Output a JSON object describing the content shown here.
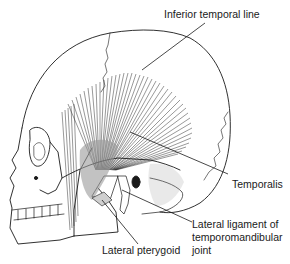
{
  "figure": {
    "labels": {
      "inferior_temporal_line": "Inferior temporal line",
      "temporalis": "Temporalis",
      "lateral_ligament": "Lateral ligament of temporomandibular joint",
      "lateral_ligament_line1": "Lateral ligament of",
      "lateral_ligament_line2": "temporomandibular",
      "lateral_ligament_line3": "joint",
      "lateral_pterygoid": "Lateral pterygoid"
    },
    "colors": {
      "ink": "#1a1a1a",
      "background": "#ffffff",
      "stipple": "#9a9a9a"
    }
  }
}
